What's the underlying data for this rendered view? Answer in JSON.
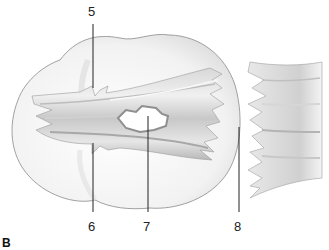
{
  "figure": {
    "panel_label": "B",
    "callouts": [
      {
        "id": "5",
        "label": "5"
      },
      {
        "id": "6",
        "label": "6"
      },
      {
        "id": "7",
        "label": "7"
      },
      {
        "id": "8",
        "label": "8"
      }
    ],
    "colors": {
      "outline": "#8a8a8a",
      "body_fill": "#f4f4f4",
      "fiber_light": "#e2e2e2",
      "fiber_mid": "#c4c4c4",
      "fiber_dark": "#9a9a9a",
      "leader_line": "#222222"
    }
  }
}
